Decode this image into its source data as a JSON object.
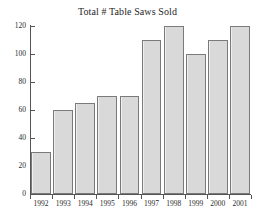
{
  "chart_data": {
    "type": "bar",
    "title": "Total # Table Saws Sold",
    "xlabel": "",
    "ylabel": "",
    "categories": [
      "1992",
      "1993",
      "1994",
      "1995",
      "1996",
      "1997",
      "1998",
      "1999",
      "2000",
      "2001"
    ],
    "values": [
      30,
      60,
      65,
      70,
      70,
      110,
      120,
      100,
      110,
      120
    ],
    "ylim": [
      0,
      120
    ],
    "yticks": [
      0,
      20,
      40,
      60,
      80,
      100,
      120
    ],
    "ytick_labels": [
      "0",
      "20",
      "40",
      "60",
      "80",
      "100",
      "120"
    ],
    "grid": false,
    "legend": null,
    "series": [
      {
        "name": "Total # Table Saws Sold",
        "values": [
          30,
          60,
          65,
          70,
          70,
          110,
          120,
          100,
          110,
          120
        ],
        "color": "#d9d9d9",
        "edge_color": "#7a7a7a"
      }
    ]
  },
  "figure": {
    "background_color": "#ffffff",
    "axis_color": "#555555",
    "text_color": "#2b2b2b"
  }
}
